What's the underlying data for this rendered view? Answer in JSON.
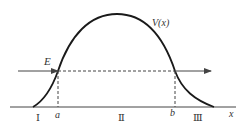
{
  "diagram": {
    "type": "potential-barrier",
    "colors": {
      "curve": "#1a1a1a",
      "lines": "#444444",
      "text": "#333333",
      "background": "#ffffff"
    },
    "labels": {
      "potential": "V(x)",
      "energy": "E",
      "point_a": "a",
      "point_b": "b",
      "x_axis": "x",
      "region_1": "Ⅰ",
      "region_2": "Ⅱ",
      "region_3": "Ⅲ"
    }
  }
}
